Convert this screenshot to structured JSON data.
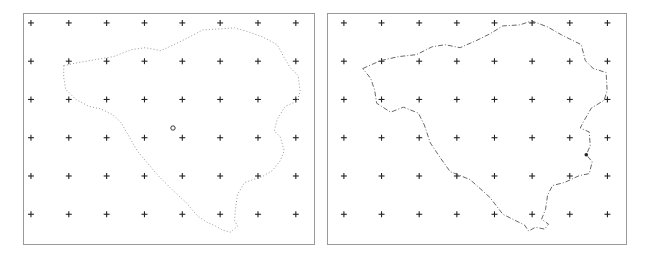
{
  "figure": {
    "panels": [
      {
        "id": "left",
        "name": "left-panel",
        "grid": {
          "columns": 8,
          "rows": 6,
          "marker": "cross"
        },
        "outline_style": "sparse-dotted",
        "markers": [
          {
            "type": "circle",
            "label": "center-point"
          }
        ]
      },
      {
        "id": "right",
        "name": "right-panel",
        "grid": {
          "columns": 8,
          "rows": 6,
          "marker": "cross"
        },
        "outline_style": "dash-dot",
        "markers": [
          {
            "type": "dot",
            "label": "highlighted-point"
          }
        ]
      }
    ],
    "colors": {
      "frame": "#9a9a9a",
      "cross": "#222222",
      "outline_left": "#8a8a8a",
      "outline_right": "#555555",
      "background": "#ffffff"
    }
  }
}
